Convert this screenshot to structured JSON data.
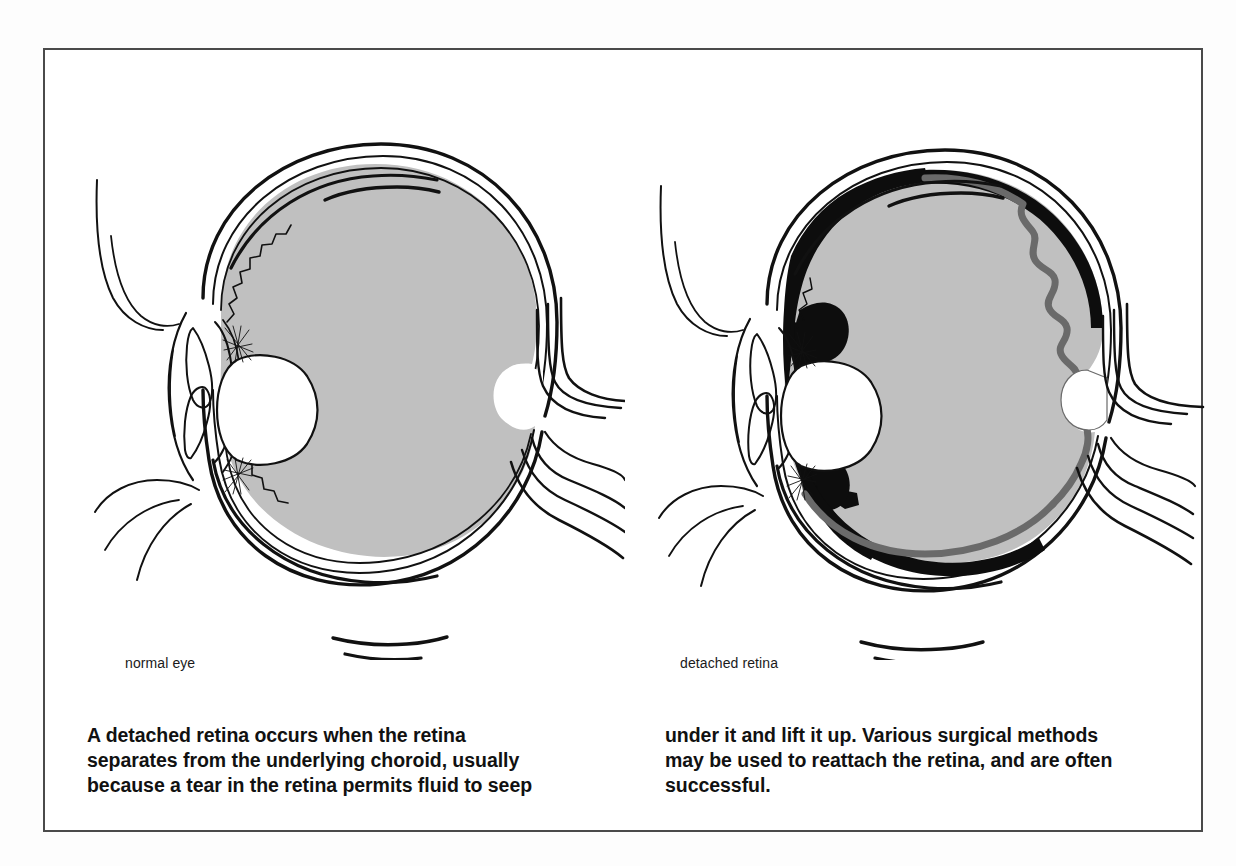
{
  "figure": {
    "frame_border_color": "#4a4a4a",
    "page_background": "#fdfdfd",
    "panel_background": "#ffffff"
  },
  "colors": {
    "vitreous_gray": "#c0c0c0",
    "outline_black": "#111111",
    "detached_retina_gray": "#6a6a6a",
    "detachment_black": "#0d0d0d",
    "lens_white": "#ffffff"
  },
  "panels": [
    {
      "id": "normal-eye",
      "label": "normal eye",
      "parts": [
        "sclera",
        "choroid",
        "retina",
        "vitreous body",
        "lens",
        "ciliary body",
        "zonule fibers",
        "iris",
        "cornea",
        "ora serrata",
        "optic disc",
        "optic nerve",
        "extraocular muscle"
      ]
    },
    {
      "id": "detached-retina-eye",
      "label": "detached retina",
      "parts": [
        "sclera",
        "choroid",
        "detached retina",
        "subretinal fluid",
        "vitreous body",
        "lens",
        "ciliary body",
        "zonule fibers",
        "iris",
        "cornea",
        "retinal tear",
        "optic disc",
        "optic nerve",
        "extraocular muscle"
      ]
    }
  ],
  "caption": {
    "left_column": "A detached retina occurs when the retina separates from the underlying choroid, usually because a tear in the retina permits fluid to seep",
    "right_column": "under it and lift it up. Various surgical methods may be used to reattach the retina, and are often successful."
  }
}
